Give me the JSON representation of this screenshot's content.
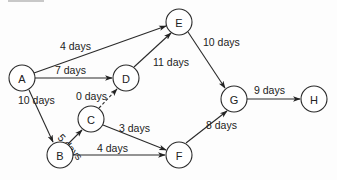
{
  "diagram": {
    "type": "network-activity-diagram",
    "nodes": [
      {
        "id": "A",
        "label": "A",
        "x": 22,
        "y": 78
      },
      {
        "id": "B",
        "label": "B",
        "x": 60,
        "y": 155
      },
      {
        "id": "C",
        "label": "C",
        "x": 91,
        "y": 119
      },
      {
        "id": "D",
        "label": "D",
        "x": 126,
        "y": 78
      },
      {
        "id": "E",
        "label": "E",
        "x": 179,
        "y": 22
      },
      {
        "id": "F",
        "label": "F",
        "x": 179,
        "y": 155
      },
      {
        "id": "G",
        "label": "G",
        "x": 234,
        "y": 99
      },
      {
        "id": "H",
        "label": "H",
        "x": 314,
        "y": 99
      }
    ],
    "edges": [
      {
        "from": "A",
        "to": "E",
        "label": "4 days",
        "style": "solid"
      },
      {
        "from": "A",
        "to": "D",
        "label": "7 days",
        "style": "solid"
      },
      {
        "from": "A",
        "to": "B",
        "label": "10 days",
        "style": "solid"
      },
      {
        "from": "B",
        "to": "C",
        "label": "5 days",
        "style": "solid"
      },
      {
        "from": "C",
        "to": "D",
        "label": "0 days",
        "style": "dashed"
      },
      {
        "from": "C",
        "to": "F",
        "label": "3 days",
        "style": "solid"
      },
      {
        "from": "B",
        "to": "F",
        "label": "4 days",
        "style": "solid"
      },
      {
        "from": "D",
        "to": "E",
        "label": "11 days",
        "style": "solid"
      },
      {
        "from": "E",
        "to": "G",
        "label": "10 days",
        "style": "solid"
      },
      {
        "from": "F",
        "to": "G",
        "label": "8 days",
        "style": "solid"
      },
      {
        "from": "G",
        "to": "H",
        "label": "9 days",
        "style": "solid"
      }
    ]
  },
  "labels": {
    "A_E": "4 days",
    "A_D": "7 days",
    "A_B": "10 days",
    "B_C": "5 days",
    "C_D": "0 days",
    "C_F": "3 days",
    "B_F": "4 days",
    "D_E": "11 days",
    "E_G": "10 days",
    "F_G": "8 days",
    "G_H": "9 days"
  },
  "node_labels": {
    "A": "A",
    "B": "B",
    "C": "C",
    "D": "D",
    "E": "E",
    "F": "F",
    "G": "G",
    "H": "H"
  }
}
